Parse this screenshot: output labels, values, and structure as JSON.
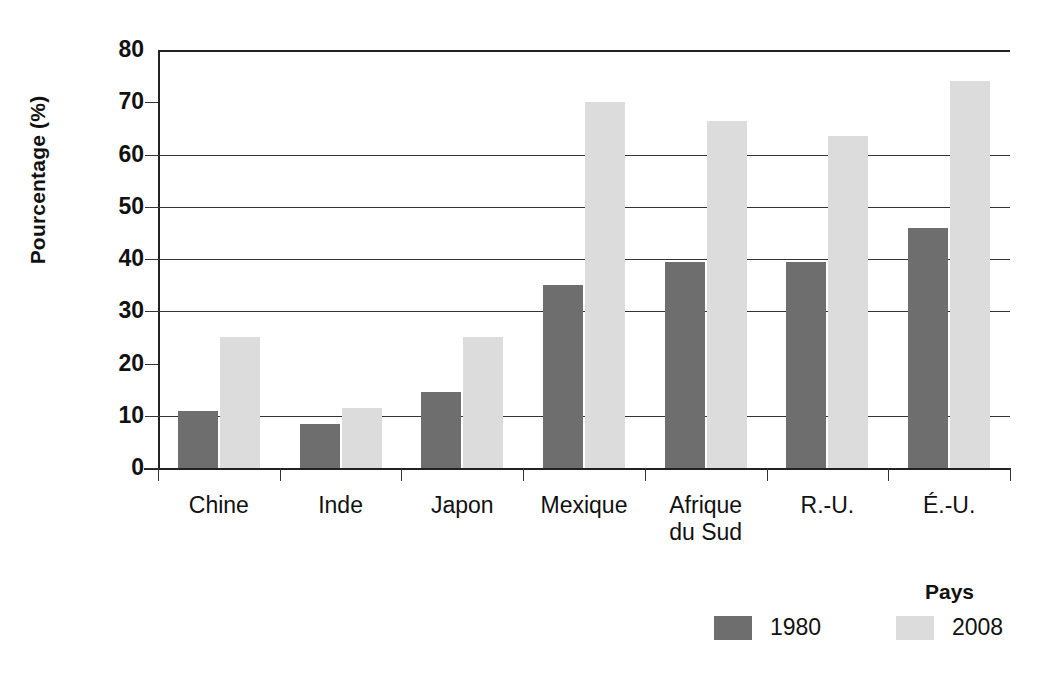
{
  "chart_data": {
    "type": "bar",
    "title": "",
    "subtitle": "",
    "xlabel": "",
    "ylabel": "Pourcentage (%)",
    "ylim": [
      0,
      80
    ],
    "ytick_labels": [
      "0",
      "10",
      "20",
      "30",
      "40",
      "50",
      "60",
      "70",
      "80"
    ],
    "ytick_values": [
      0,
      10,
      20,
      30,
      40,
      50,
      60,
      70,
      80
    ],
    "gridlines_at": [
      10,
      30,
      40,
      50,
      60
    ],
    "grid": true,
    "legend_position": "bottom-right",
    "legend_title": "Pays",
    "categories": [
      "Chine",
      "Inde",
      "Japon",
      "Mexique",
      "Afrique\ndu Sud",
      "R.-U.",
      "É.-U."
    ],
    "series": [
      {
        "name": "1980",
        "color": "#6e6e6e",
        "values": [
          11,
          8.5,
          14.5,
          35,
          39.5,
          39.5,
          46
        ]
      },
      {
        "name": "2008",
        "color": "#dcdcdc",
        "values": [
          25,
          11.5,
          25,
          70,
          66.5,
          63.5,
          74
        ]
      }
    ]
  },
  "axis": {
    "frame_color": "#222222",
    "grid_color": "#333333"
  }
}
